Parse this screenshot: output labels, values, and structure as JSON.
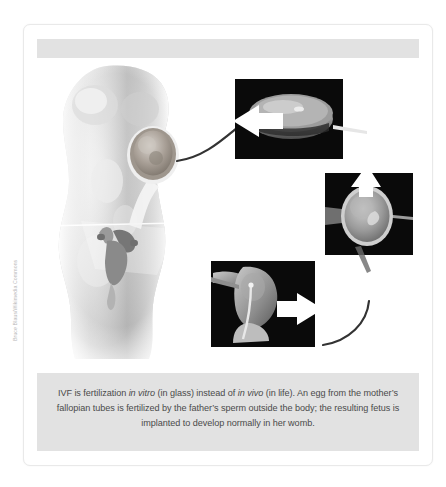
{
  "figure": {
    "source_credit": "Bruce Blaus/Wikimedia Commons",
    "header_band_label": "",
    "caption": {
      "segments": [
        {
          "text": "IVF is fertilization ",
          "style": "normal"
        },
        {
          "text": "in vitro",
          "style": "italic"
        },
        {
          "text": " (in glass) instead of ",
          "style": "normal"
        },
        {
          "text": "in vivo",
          "style": "italic"
        },
        {
          "text": " (in life). An egg from the mother’s fallopian tubes is fertilized by the father’s sperm outside the body; the resulting fetus is implanted to develop normally in her womb.",
          "style": "normal"
        }
      ],
      "plain_text": "IVF is fertilization in vitro (in glass) instead of in vivo (in life). An egg from the mother’s fallopian tubes is fertilized by the father’s sperm outside the body; the resulting fetus is implanted to develop normally in her womb."
    },
    "panels": [
      {
        "id": "ovary-body",
        "label": "female torso with magnified ovary and fallopian tube",
        "arrow": "egg retrieval arrow out of ovary"
      },
      {
        "id": "petri-dish",
        "label": "petri dish containing culture medium",
        "arrow": "white arrow pointing into dish from left"
      },
      {
        "id": "icsi-egg",
        "label": "egg held by micropipette during sperm injection",
        "arrow": "white arrow pointing down into egg"
      },
      {
        "id": "uterus-transfer",
        "label": "embryo transfer catheter entering uterus",
        "arrow": "white arrow pointing into uterus from right"
      }
    ],
    "colors": {
      "page_background": "#ffffff",
      "card_border": "#e9e9e9",
      "band_grey": "#e2e2e2",
      "caption_text": "#4a4a4a",
      "credit_text": "#b9b9b9",
      "photo_black": "#0a0a0a",
      "arrow_white": "#ffffff",
      "flow_line": "#333333",
      "body_grey": "#b7b7b7"
    }
  }
}
